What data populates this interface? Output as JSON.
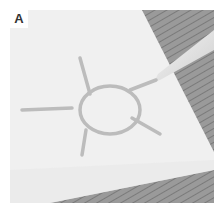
{
  "panel": {
    "label": "A",
    "description": "Photo of white paper on wooden surface with a sun shape drawn in glue, pipette tip touching the end of a ray"
  },
  "colors": {
    "paper": "#f1f1f1",
    "wood": "#8f8f8f",
    "glue": "#bdbdbd",
    "pipette": "#e0e0e0"
  }
}
